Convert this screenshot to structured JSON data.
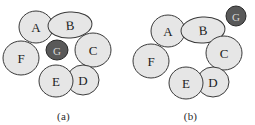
{
  "figure": {
    "background_color": "#ffffff",
    "node_fill_color": "#e6e6e6",
    "node_stroke_color": "#3a3a3a",
    "goal_fill_color": "#595959",
    "goal_stroke_color": "#2a2a2a",
    "goal_label_color": "#d8d8d8",
    "label_color": "#1d1d1d"
  },
  "panels": [
    {
      "id": "a",
      "caption": "(a)",
      "nodes": [
        {
          "label": "A",
          "cx": 36,
          "cy": 27,
          "rx": 17,
          "ry": 16,
          "rotate": 0,
          "kind": "normal"
        },
        {
          "label": "B",
          "cx": 70,
          "cy": 25,
          "rx": 22,
          "ry": 13,
          "rotate": -4,
          "kind": "normal"
        },
        {
          "label": "C",
          "cx": 93,
          "cy": 50,
          "rx": 18,
          "ry": 17,
          "rotate": 0,
          "kind": "normal"
        },
        {
          "label": "D",
          "cx": 83,
          "cy": 80,
          "rx": 16,
          "ry": 15,
          "rotate": 0,
          "kind": "normal"
        },
        {
          "label": "E",
          "cx": 56,
          "cy": 81,
          "rx": 17,
          "ry": 16,
          "rotate": 0,
          "kind": "normal"
        },
        {
          "label": "F",
          "cx": 21,
          "cy": 58,
          "rx": 18,
          "ry": 17,
          "rotate": 0,
          "kind": "normal"
        },
        {
          "label": "G",
          "cx": 57,
          "cy": 50,
          "rx": 11,
          "ry": 10,
          "rotate": 0,
          "kind": "goal"
        }
      ]
    },
    {
      "id": "b",
      "caption": "(b)",
      "nodes": [
        {
          "label": "A",
          "cx": 41,
          "cy": 31,
          "rx": 17,
          "ry": 16,
          "rotate": 0,
          "kind": "normal"
        },
        {
          "label": "B",
          "cx": 76,
          "cy": 30,
          "rx": 22,
          "ry": 13,
          "rotate": -4,
          "kind": "normal"
        },
        {
          "label": "C",
          "cx": 97,
          "cy": 53,
          "rx": 18,
          "ry": 17,
          "rotate": 0,
          "kind": "normal"
        },
        {
          "label": "D",
          "cx": 86,
          "cy": 82,
          "rx": 16,
          "ry": 15,
          "rotate": 0,
          "kind": "normal"
        },
        {
          "label": "E",
          "cx": 59,
          "cy": 83,
          "rx": 17,
          "ry": 16,
          "rotate": 0,
          "kind": "normal"
        },
        {
          "label": "F",
          "cx": 24,
          "cy": 61,
          "rx": 18,
          "ry": 17,
          "rotate": 0,
          "kind": "normal"
        },
        {
          "label": "G",
          "cx": 109,
          "cy": 16,
          "rx": 10,
          "ry": 10,
          "rotate": 0,
          "kind": "goal"
        }
      ]
    }
  ]
}
